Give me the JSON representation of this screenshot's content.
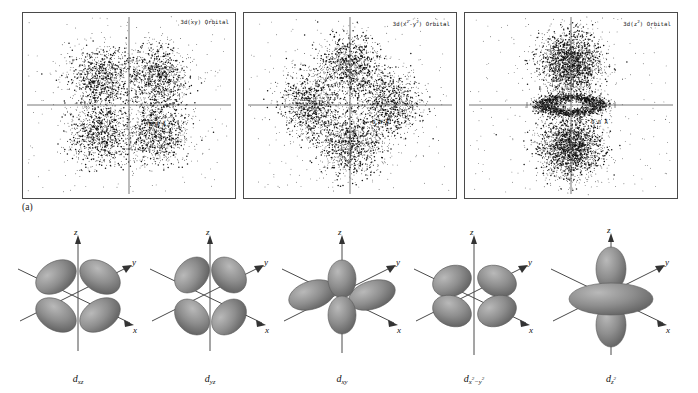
{
  "figure": {
    "panel_a_letter": "(a)",
    "panel_b_letter": "(b)"
  },
  "panel_a": {
    "plots": [
      {
        "caption_main": "3d(xy) Orbital",
        "caption_base": "3d(xy) Orbital",
        "scale_label": "0.8 Å",
        "orbital": "3d(xy)"
      },
      {
        "caption_main": "3d(x",
        "caption_base": "3d(x2-y2) Orbital",
        "scale_label": "0.8 Å",
        "orbital": "3d(x2-y2)"
      },
      {
        "caption_main": "3d(z",
        "caption_base": "3d(z2) Orbital",
        "scale_label": "0.8 Å",
        "orbital": "3d(z2)"
      }
    ]
  },
  "panel_b": {
    "orbitals": [
      {
        "name": "dxz",
        "label_d": "d",
        "label_sub": "xz",
        "axes": {
          "z": "z",
          "y": "y",
          "x": "x"
        }
      },
      {
        "name": "dyz",
        "label_d": "d",
        "label_sub": "yz",
        "axes": {
          "z": "z",
          "y": "y",
          "x": "x"
        }
      },
      {
        "name": "dxy",
        "label_d": "d",
        "label_sub": "xy",
        "axes": {
          "z": "z",
          "y": "y",
          "x": "x"
        }
      },
      {
        "name": "dx2-y2",
        "label_d": "d",
        "label_sub": "x",
        "axes": {
          "z": "z",
          "y": "y",
          "x": "x"
        }
      },
      {
        "name": "dz2",
        "label_d": "d",
        "label_sub": "z",
        "axes": {
          "z": "z",
          "y": "y",
          "x": "x"
        }
      }
    ]
  },
  "chart_data": {
    "type": "scatter",
    "grid": false,
    "legend": null,
    "xlabel": "",
    "ylabel": "",
    "axis_scale_bar": "0.8 Å",
    "panels": [
      {
        "label": "3d(xy) Orbital",
        "lobes": 4,
        "lobe_centers": [
          {
            "x": -0.55,
            "y": 0.55
          },
          {
            "x": 0.55,
            "y": 0.55
          },
          {
            "x": -0.55,
            "y": -0.55
          },
          {
            "x": 0.55,
            "y": -0.55
          }
        ],
        "dot_count": 4000,
        "nodal_planes": [
          "x",
          "y"
        ]
      },
      {
        "label": "3d(x2-y2) Orbital",
        "lobes": 4,
        "lobe_centers": [
          {
            "x": 0.0,
            "y": 0.75
          },
          {
            "x": 0.0,
            "y": -0.75
          },
          {
            "x": -0.75,
            "y": 0.0
          },
          {
            "x": 0.75,
            "y": 0.0
          }
        ],
        "dot_count": 4200,
        "nodal_planes": [
          "diagonal"
        ]
      },
      {
        "label": "3d(z2) Orbital",
        "lobes": 2,
        "lobe_centers": [
          {
            "x": 0.0,
            "y": 0.8
          },
          {
            "x": 0.0,
            "y": -0.8
          }
        ],
        "torus": true,
        "dot_count": 4200,
        "nodal_planes": [
          "cone"
        ]
      }
    ]
  },
  "colors": {
    "frame": "#4a4a4a",
    "dot": "#111111",
    "axis": "#555555",
    "lobe_light": "#a8a8a8",
    "lobe_mid": "#8c8c8c",
    "lobe_dark": "#6e6e6e",
    "text": "#111111",
    "background": "#ffffff"
  }
}
